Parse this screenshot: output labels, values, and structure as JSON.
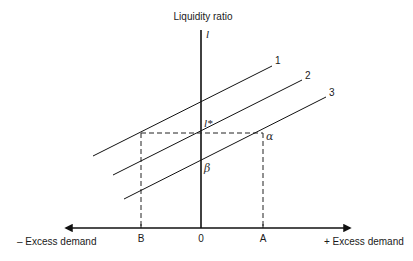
{
  "diagram": {
    "y_axis_title": "Liquidity ratio",
    "y_axis_symbol": "l",
    "x_axis_left_label": "– Excess demand",
    "x_axis_right_label": "+ Excess demand",
    "x_ticks": [
      {
        "label": "B",
        "x": 141
      },
      {
        "label": "0",
        "x": 201
      },
      {
        "label": "A",
        "x": 263
      }
    ],
    "points": {
      "l_star": "l*",
      "alpha": "α",
      "beta": "β"
    },
    "lines": [
      {
        "label": "1",
        "x1": 93,
        "y1": 156,
        "x2": 272,
        "y2": 66
      },
      {
        "label": "2",
        "x1": 113,
        "y1": 175,
        "x2": 302,
        "y2": 80
      },
      {
        "label": "3",
        "x1": 124,
        "y1": 199,
        "x2": 326,
        "y2": 97
      }
    ],
    "dashed_guides": {
      "horizontal_y": 133,
      "left_x": 141,
      "right_x": 263
    }
  }
}
